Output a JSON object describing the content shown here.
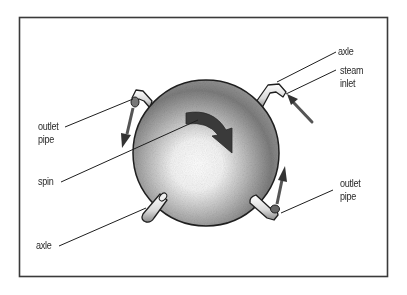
{
  "diagram": {
    "colors": {
      "frame": "#3a3a3a",
      "ink": "#1e1e1e",
      "sphere_light": "#ffffff",
      "sphere_mid": "#b8b8b8",
      "sphere_dark": "#6e6e6e",
      "arrow": "#333333"
    },
    "labels": {
      "axle_top": "axle",
      "steam_inlet_line1": "steam",
      "steam_inlet_line2": "inlet",
      "outlet_pipe_left_line1": "outlet",
      "outlet_pipe_left_line2": "pipe",
      "spin": "spin",
      "outlet_pipe_right_line1": "outlet",
      "outlet_pipe_right_line2": "pipe",
      "axle_bottom": "axle"
    }
  }
}
